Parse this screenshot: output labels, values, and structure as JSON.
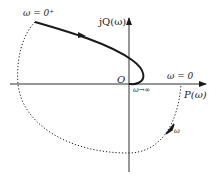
{
  "diagram": {
    "type": "nyquist_plot",
    "axes": {
      "horizontal_label": "P(ω)",
      "vertical_label": "jQ(ω)",
      "origin_label": "O"
    },
    "annotations": {
      "start": "ω = 0⁺",
      "real_axis_point": "ω = 0",
      "end": "ω→∞",
      "arc_direction": "ω"
    },
    "curves": [
      {
        "name": "frequency-response",
        "style": "solid",
        "from": "ω = 0⁺",
        "to": "O (ω→∞)",
        "direction_arrow": true
      },
      {
        "name": "infinite-radius-arc",
        "style": "dotted",
        "from": "ω = 0⁺",
        "to": "ω = 0",
        "direction": "ω",
        "direction_arrow": true
      }
    ],
    "colors": {
      "stroke": "#1a1a1a",
      "background": "#ffffff"
    }
  }
}
